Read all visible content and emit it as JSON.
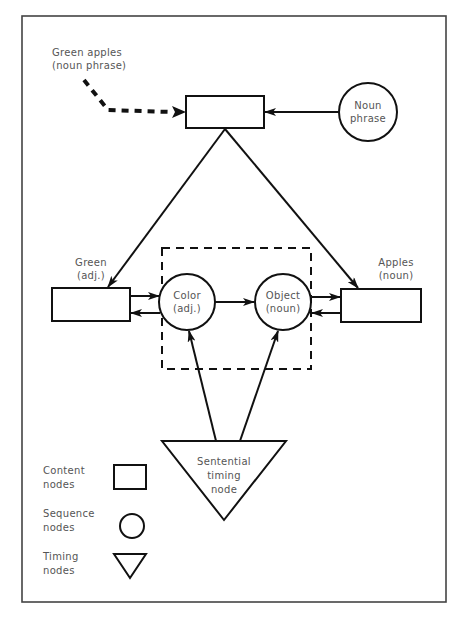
{
  "diagram": {
    "type": "network-diagram",
    "nodes": {
      "top_content": {
        "kind": "content",
        "label": ""
      },
      "noun_phrase": {
        "kind": "sequence",
        "line1": "Noun",
        "line2": "phrase"
      },
      "green": {
        "kind": "content",
        "line1": "Green",
        "line2": "(adj.)"
      },
      "apples": {
        "kind": "content",
        "line1": "Apples",
        "line2": "(noun)"
      },
      "color": {
        "kind": "sequence",
        "line1": "Color",
        "line2": "(adj.)"
      },
      "object": {
        "kind": "sequence",
        "line1": "Object",
        "line2": "(noun)"
      },
      "timing": {
        "kind": "timing",
        "line1": "Sentential",
        "line2": "timing",
        "line3": "node"
      }
    },
    "input": {
      "line1": "Green apples",
      "line2": "(noun phrase)",
      "style": "dashed-arrow"
    },
    "edges": [
      {
        "from": "input",
        "to": "top_content",
        "style": "dashed"
      },
      {
        "from": "noun_phrase",
        "to": "top_content"
      },
      {
        "from": "top_content",
        "to": "green"
      },
      {
        "from": "top_content",
        "to": "apples"
      },
      {
        "from": "green",
        "to": "color"
      },
      {
        "from": "color",
        "to": "green"
      },
      {
        "from": "color",
        "to": "object"
      },
      {
        "from": "object",
        "to": "apples"
      },
      {
        "from": "apples",
        "to": "object"
      },
      {
        "from": "timing",
        "to": "color"
      },
      {
        "from": "timing",
        "to": "object"
      }
    ],
    "group": {
      "style": "dashed-box",
      "members": [
        "color",
        "object"
      ]
    }
  },
  "legend": {
    "items": [
      {
        "line1": "Content",
        "line2": "nodes",
        "shape": "rectangle"
      },
      {
        "line1": "Sequence",
        "line2": "nodes",
        "shape": "circle"
      },
      {
        "line1": "Timing",
        "line2": "nodes",
        "shape": "triangle"
      }
    ]
  }
}
